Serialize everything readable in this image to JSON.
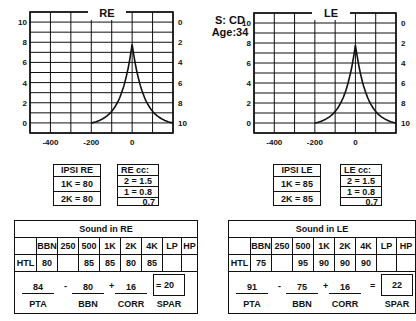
{
  "subject": {
    "id_label": "S: CD",
    "age_label": "Age:34"
  },
  "chart_data": [
    {
      "type": "line",
      "title": "RE",
      "x_ticks": [
        "-400",
        "-200",
        "0"
      ],
      "y_left_ticks": [
        "10",
        "8",
        "6",
        "4",
        "2",
        "0"
      ],
      "y_right_ticks": [
        "0",
        "2",
        "4",
        "6",
        "8",
        "10"
      ],
      "xlim": [
        -500,
        200
      ],
      "ylim": [
        -1,
        11
      ],
      "grid": true,
      "series": [
        {
          "name": "RE tympanogram",
          "x": [
            -200,
            -150,
            -100,
            -50,
            -20,
            0,
            20,
            50,
            100,
            150,
            200
          ],
          "y": [
            0,
            0.3,
            1,
            2.5,
            4.2,
            7.5,
            4.2,
            2.5,
            1,
            0.3,
            0
          ]
        }
      ]
    },
    {
      "type": "line",
      "title": "LE",
      "x_ticks": [
        "-400",
        "-200",
        "0"
      ],
      "y_left_ticks": [
        "10",
        "8",
        "6",
        "4",
        "2",
        "0"
      ],
      "y_right_ticks": [
        "0",
        "2",
        "4",
        "6",
        "8",
        "10"
      ],
      "xlim": [
        -500,
        200
      ],
      "ylim": [
        -1,
        11
      ],
      "grid": true,
      "series": [
        {
          "name": "LE tympanogram",
          "x": [
            -200,
            -150,
            -100,
            -50,
            -20,
            0,
            20,
            50,
            100,
            150,
            200
          ],
          "y": [
            0,
            0.3,
            1,
            2.5,
            4.2,
            7.5,
            4.2,
            2.5,
            1,
            0.3,
            0
          ]
        }
      ]
    }
  ],
  "ipsi": {
    "re": {
      "title": "IPSI RE",
      "rows": [
        "1K = 80",
        "2K = 80"
      ]
    },
    "le": {
      "title": "IPSI LE",
      "rows": [
        "1K = 85",
        "2K = 85"
      ]
    }
  },
  "cc": {
    "re": {
      "title": "RE cc:",
      "rows": [
        "2 = 1.5",
        "1 = 0.8",
        "0.7"
      ]
    },
    "le": {
      "title": "LE cc:",
      "rows": [
        "2 = 1.5",
        "1 = 0.8",
        "0.7"
      ]
    }
  },
  "sound": {
    "re": {
      "title": "Sound in RE",
      "headers": [
        "",
        "BBN",
        "250",
        "500",
        "1K",
        "2K",
        "4K",
        "LP",
        "HP"
      ],
      "row": [
        "HTL",
        "80",
        "",
        "85",
        "85",
        "80",
        "85",
        "",
        ""
      ],
      "formula": {
        "pta": "84",
        "minus": "-",
        "bbn": "80",
        "plus": "+",
        "corr": "16",
        "equals": "=",
        "spar": "20",
        "labels": {
          "pta": "PTA",
          "bbn": "BBN",
          "corr": "CORR",
          "spar": "SPAR"
        }
      }
    },
    "le": {
      "title": "Sound in LE",
      "headers": [
        "",
        "BBN",
        "250",
        "500",
        "1K",
        "2K",
        "4K",
        "LP",
        "HP"
      ],
      "row": [
        "HTL",
        "75",
        "",
        "95",
        "90",
        "90",
        "90",
        "",
        ""
      ],
      "formula": {
        "pta": "91",
        "minus": "-",
        "bbn": "75",
        "plus": "+",
        "corr": "16",
        "equals": "=",
        "spar": "22",
        "labels": {
          "pta": "PTA",
          "bbn": "BBN",
          "corr": "CORR",
          "spar": "SPAR"
        }
      }
    }
  }
}
